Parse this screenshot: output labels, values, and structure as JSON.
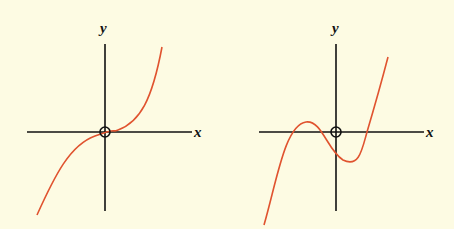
{
  "colors": {
    "background": "#fdfbe3",
    "axis": "#111111",
    "curve": "#e0532f"
  },
  "figures": [
    {
      "id": "left",
      "description": "cubic curve with inflection at origin, monotonically increasing",
      "x_label": "x",
      "y_label": "y",
      "origin_marker": "circle-with-cross",
      "curve_points": [
        [
          37,
          215
        ],
        [
          60,
          175
        ],
        [
          80,
          148
        ],
        [
          95,
          137
        ],
        [
          105,
          133
        ],
        [
          115,
          130
        ],
        [
          130,
          122
        ],
        [
          145,
          100
        ],
        [
          162,
          47
        ]
      ]
    },
    {
      "id": "right",
      "description": "cubic curve with local maximum left of the y-axis and local minimum right of the y-axis, three real roots",
      "x_label": "x",
      "y_label": "y",
      "origin_marker": "circle-with-cross",
      "curve_points": [
        [
          264,
          225
        ],
        [
          293,
          132
        ],
        [
          306,
          122
        ],
        [
          320,
          130
        ],
        [
          336,
          152
        ],
        [
          343,
          160
        ],
        [
          355,
          153
        ],
        [
          367,
          132
        ],
        [
          388,
          57
        ]
      ]
    }
  ]
}
